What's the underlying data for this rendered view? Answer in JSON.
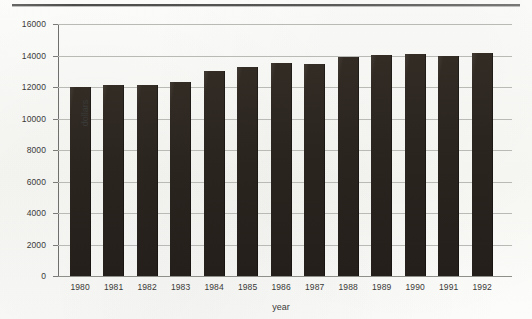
{
  "chart_data": {
    "type": "bar",
    "title": "",
    "xlabel": "year",
    "ylabel": "dollars",
    "categories": [
      "1980",
      "1981",
      "1982",
      "1983",
      "1984",
      "1985",
      "1986",
      "1987",
      "1988",
      "1989",
      "1990",
      "1991",
      "1992"
    ],
    "values": [
      12000,
      12150,
      12120,
      12350,
      13000,
      13250,
      13500,
      13480,
      13900,
      14050,
      14100,
      13980,
      14150
    ],
    "ylim": [
      0,
      16000
    ],
    "ytick_labels": [
      "0",
      "2000",
      "4000",
      "6000",
      "8000",
      "10000",
      "12000",
      "14000",
      "16000"
    ],
    "ytick_values": [
      0,
      2000,
      4000,
      6000,
      8000,
      10000,
      12000,
      14000,
      16000
    ],
    "grid": true,
    "legend": "none",
    "bar_color": "#2b2520",
    "gridline_color": "#b9b9b6",
    "axis_color": "#6f6f6d",
    "background_color": "#fbfbf9"
  }
}
